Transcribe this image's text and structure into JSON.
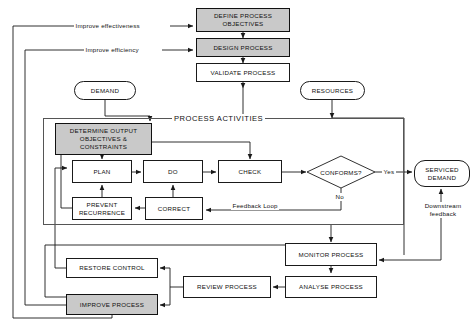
{
  "diagram": {
    "group_label": "PROCESS ACTIVITIES",
    "colors": {
      "shaded_fill": "#c9c9c9",
      "line": "#1a1a1a",
      "background": "#ffffff"
    },
    "nodes": {
      "define_process_objectives": {
        "label": "DEFINE PROCESS\nOBJECTIVES",
        "shape": "rect",
        "shaded": true
      },
      "design_process": {
        "label": "DESIGN PROCESS",
        "shape": "rect",
        "shaded": true
      },
      "validate_process": {
        "label": "VALIDATE PROCESS",
        "shape": "rect",
        "shaded": false
      },
      "demand": {
        "label": "DEMAND",
        "shape": "oval",
        "shaded": false
      },
      "resources": {
        "label": "RESOURCES",
        "shape": "oval",
        "shaded": false
      },
      "determine_output": {
        "label": "DETERMINE OUTPUT\nOBJECTIVES &\nCONSTRAINTS",
        "shape": "rect",
        "shaded": true
      },
      "plan": {
        "label": "PLAN",
        "shape": "rect",
        "shaded": false
      },
      "do": {
        "label": "DO",
        "shape": "rect",
        "shaded": false
      },
      "check": {
        "label": "CHECK",
        "shape": "rect",
        "shaded": false
      },
      "prevent_recurrence": {
        "label": "PREVENT\nRECURRENCE",
        "shape": "rect",
        "shaded": false
      },
      "correct": {
        "label": "CORRECT",
        "shape": "rect",
        "shaded": false
      },
      "conforms": {
        "label": "CONFORMS?",
        "shape": "diamond",
        "shaded": false
      },
      "serviced_demand": {
        "label": "SERVICED\nDEMAND",
        "shape": "oval",
        "shaded": false
      },
      "monitor_process": {
        "label": "MONITOR PROCESS",
        "shape": "rect",
        "shaded": false
      },
      "analyse_process": {
        "label": "ANALYSE PROCESS",
        "shape": "rect",
        "shaded": false
      },
      "review_process": {
        "label": "REVIEW PROCESS",
        "shape": "rect",
        "shaded": false
      },
      "restore_control": {
        "label": "RESTORE CONTROL",
        "shape": "rect",
        "shaded": false
      },
      "improve_process": {
        "label": "IMPROVE PROCESS",
        "shape": "rect",
        "shaded": true
      }
    },
    "edge_labels": {
      "improve_effectiveness": "Improve effectiveness",
      "improve_efficiency": "Improve efficiency",
      "yes": "Yes",
      "no": "No",
      "feedback_loop": "Feedback Loop",
      "downstream_feedback": "Downstream\nfeedback"
    }
  }
}
